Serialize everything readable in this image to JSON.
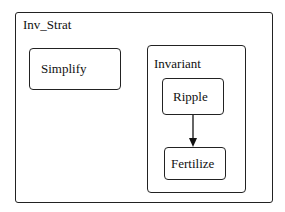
{
  "diagram": {
    "outer": {
      "label": "Inv_Strat"
    },
    "simplify": {
      "label": "Simplify"
    },
    "invariant": {
      "label": "Invariant",
      "ripple": {
        "label": "Ripple"
      },
      "fertilize": {
        "label": "Fertilize"
      }
    },
    "edges": [
      {
        "from": "Ripple",
        "to": "Fertilize"
      }
    ]
  }
}
